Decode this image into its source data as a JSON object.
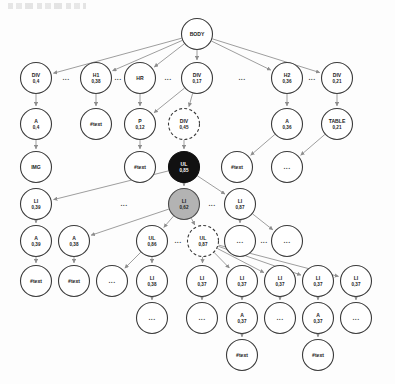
{
  "figure": {
    "kind": "dom-tree-diagram",
    "ellipsis_glyph": "...",
    "unlabeled_glyph": "...",
    "colors": {
      "node_stroke": "#3b3b3b",
      "node_fill": "#ffffff",
      "highlight_black": "#111111",
      "highlight_grey": "#b3b3b3",
      "edge": "#8d8d8d",
      "text": "#1c1c1c"
    }
  },
  "nodes": [
    {
      "id": "body",
      "label": "BODY",
      "value": "",
      "cx": 197,
      "cy": 34,
      "r": 15.5,
      "style": "plain"
    },
    {
      "id": "div-04",
      "label": "DIV",
      "value": "0,4",
      "cx": 36,
      "cy": 78,
      "r": 15.5,
      "style": "plain"
    },
    {
      "id": "h1-038",
      "label": "H1",
      "value": "0,38",
      "cx": 96,
      "cy": 78,
      "r": 15.5,
      "style": "plain"
    },
    {
      "id": "hr",
      "label": "HR",
      "value": "",
      "cx": 140,
      "cy": 78,
      "r": 15.5,
      "style": "plain"
    },
    {
      "id": "div-017",
      "label": "DIV",
      "value": "0,17",
      "cx": 197,
      "cy": 78,
      "r": 15.5,
      "style": "plain"
    },
    {
      "id": "h2-036",
      "label": "H2",
      "value": "0,36",
      "cx": 287,
      "cy": 78,
      "r": 15.5,
      "style": "plain"
    },
    {
      "id": "div-021",
      "label": "DIV",
      "value": "0,21",
      "cx": 337,
      "cy": 78,
      "r": 15.5,
      "style": "plain"
    },
    {
      "id": "a-04",
      "label": "A",
      "value": "0,4",
      "cx": 36,
      "cy": 124,
      "r": 15.5,
      "style": "plain"
    },
    {
      "id": "text-h1",
      "label": "#text",
      "value": "",
      "cx": 96,
      "cy": 124,
      "r": 15.5,
      "style": "plain"
    },
    {
      "id": "p-012",
      "label": "P",
      "value": "0,12",
      "cx": 140,
      "cy": 124,
      "r": 15.5,
      "style": "plain"
    },
    {
      "id": "div-045",
      "label": "DIV",
      "value": "0,45",
      "cx": 184,
      "cy": 124,
      "r": 15.5,
      "style": "dashed"
    },
    {
      "id": "a-036",
      "label": "A",
      "value": "0,36",
      "cx": 287,
      "cy": 124,
      "r": 15.5,
      "style": "plain"
    },
    {
      "id": "table-021",
      "label": "TABLE",
      "value": "0,21",
      "cx": 337,
      "cy": 124,
      "r": 15.5,
      "style": "plain"
    },
    {
      "id": "img",
      "label": "IMG",
      "value": "",
      "cx": 36,
      "cy": 167,
      "r": 15.5,
      "style": "plain"
    },
    {
      "id": "text-p",
      "label": "#text",
      "value": "",
      "cx": 140,
      "cy": 167,
      "r": 15.5,
      "style": "plain"
    },
    {
      "id": "ul-085",
      "label": "UL",
      "value": "0,85",
      "cx": 184,
      "cy": 167,
      "r": 15.5,
      "style": "black"
    },
    {
      "id": "text-a2",
      "label": "#text",
      "value": "",
      "cx": 237,
      "cy": 167,
      "r": 15.5,
      "style": "plain"
    },
    {
      "id": "dots-table",
      "label": "...",
      "value": "",
      "cx": 287,
      "cy": 167,
      "r": 15.5,
      "style": "plain"
    },
    {
      "id": "li-039",
      "label": "LI",
      "value": "0,39",
      "cx": 36,
      "cy": 204,
      "r": 15.5,
      "style": "plain"
    },
    {
      "id": "li-062",
      "label": "LI",
      "value": "0,62",
      "cx": 184,
      "cy": 204,
      "r": 15.5,
      "style": "grey"
    },
    {
      "id": "li-087",
      "label": "LI",
      "value": "0,87",
      "cx": 240,
      "cy": 204,
      "r": 15.5,
      "style": "plain"
    },
    {
      "id": "a-039",
      "label": "A",
      "value": "0,39",
      "cx": 36,
      "cy": 241,
      "r": 15.5,
      "style": "plain"
    },
    {
      "id": "a-038",
      "label": "A",
      "value": "0,38",
      "cx": 74,
      "cy": 241,
      "r": 15.5,
      "style": "plain"
    },
    {
      "id": "ul-086",
      "label": "UL",
      "value": "0,86",
      "cx": 152,
      "cy": 241,
      "r": 15.5,
      "style": "plain"
    },
    {
      "id": "ul-087",
      "label": "UL",
      "value": "0,87",
      "cx": 203,
      "cy": 241,
      "r": 15.5,
      "style": "dashed"
    },
    {
      "id": "dots-li87a",
      "label": "...",
      "value": "",
      "cx": 240,
      "cy": 241,
      "r": 15.5,
      "style": "plain"
    },
    {
      "id": "dots-li87b",
      "label": "...",
      "value": "",
      "cx": 287,
      "cy": 241,
      "r": 15.5,
      "style": "plain"
    },
    {
      "id": "text-a039",
      "label": "#text",
      "value": "",
      "cx": 36,
      "cy": 281,
      "r": 15.5,
      "style": "plain"
    },
    {
      "id": "text-a038",
      "label": "#text",
      "value": "",
      "cx": 74,
      "cy": 281,
      "r": 15.5,
      "style": "plain"
    },
    {
      "id": "dots-ul86",
      "label": "...",
      "value": "",
      "cx": 112,
      "cy": 281,
      "r": 15.5,
      "style": "plain"
    },
    {
      "id": "li-038b",
      "label": "LI",
      "value": "0,38",
      "cx": 152,
      "cy": 281,
      "r": 15.5,
      "style": "plain"
    },
    {
      "id": "li-037a",
      "label": "LI",
      "value": "0,37",
      "cx": 202,
      "cy": 281,
      "r": 15.5,
      "style": "plain"
    },
    {
      "id": "li-037b",
      "label": "LI",
      "value": "0,37",
      "cx": 242,
      "cy": 281,
      "r": 15.5,
      "style": "plain"
    },
    {
      "id": "li-037c",
      "label": "LI",
      "value": "0,37",
      "cx": 280,
      "cy": 281,
      "r": 15.5,
      "style": "plain"
    },
    {
      "id": "li-037d",
      "label": "LI",
      "value": "0,37",
      "cx": 318,
      "cy": 281,
      "r": 15.5,
      "style": "plain"
    },
    {
      "id": "li-037e",
      "label": "LI",
      "value": "0,37",
      "cx": 356,
      "cy": 281,
      "r": 15.5,
      "style": "plain"
    },
    {
      "id": "dots-li38b",
      "label": "...",
      "value": "",
      "cx": 152,
      "cy": 318,
      "r": 15.5,
      "style": "plain"
    },
    {
      "id": "dots-li37a",
      "label": "...",
      "value": "",
      "cx": 202,
      "cy": 318,
      "r": 15.5,
      "style": "plain"
    },
    {
      "id": "a-037a",
      "label": "A",
      "value": "0,37",
      "cx": 242,
      "cy": 318,
      "r": 15.5,
      "style": "plain"
    },
    {
      "id": "dots-li37c",
      "label": "...",
      "value": "",
      "cx": 280,
      "cy": 318,
      "r": 15.5,
      "style": "plain"
    },
    {
      "id": "a-037b",
      "label": "A",
      "value": "0,37",
      "cx": 318,
      "cy": 318,
      "r": 15.5,
      "style": "plain"
    },
    {
      "id": "dots-li37e",
      "label": "...",
      "value": "",
      "cx": 356,
      "cy": 318,
      "r": 15.5,
      "style": "plain"
    },
    {
      "id": "text-a37a",
      "label": "#text",
      "value": "",
      "cx": 242,
      "cy": 355,
      "r": 15.5,
      "style": "plain"
    },
    {
      "id": "text-a37b",
      "label": "#text",
      "value": "",
      "cx": 318,
      "cy": 355,
      "r": 15.5,
      "style": "plain"
    }
  ],
  "edges": [
    [
      "body",
      "div-04"
    ],
    [
      "body",
      "h1-038"
    ],
    [
      "body",
      "hr"
    ],
    [
      "body",
      "div-017"
    ],
    [
      "body",
      "h2-036"
    ],
    [
      "body",
      "div-021"
    ],
    [
      "div-04",
      "a-04"
    ],
    [
      "h1-038",
      "text-h1"
    ],
    [
      "hr",
      "p-012"
    ],
    [
      "div-017",
      "div-045"
    ],
    [
      "div-017",
      "p-012"
    ],
    [
      "h2-036",
      "a-036"
    ],
    [
      "div-021",
      "table-021"
    ],
    [
      "a-04",
      "img"
    ],
    [
      "p-012",
      "text-p"
    ],
    [
      "div-045",
      "ul-085"
    ],
    [
      "a-036",
      "text-a2"
    ],
    [
      "table-021",
      "dots-table"
    ],
    [
      "ul-085",
      "li-039"
    ],
    [
      "ul-085",
      "li-062"
    ],
    [
      "ul-085",
      "li-087"
    ],
    [
      "li-039",
      "a-039"
    ],
    [
      "li-062",
      "a-038"
    ],
    [
      "li-062",
      "ul-086"
    ],
    [
      "li-062",
      "ul-087"
    ],
    [
      "li-087",
      "dots-li87a"
    ],
    [
      "li-087",
      "dots-li87b"
    ],
    [
      "a-039",
      "text-a039"
    ],
    [
      "a-038",
      "text-a038"
    ],
    [
      "ul-086",
      "dots-ul86"
    ],
    [
      "ul-086",
      "li-038b"
    ],
    [
      "ul-087",
      "li-037a"
    ],
    [
      "ul-087",
      "li-037b"
    ],
    [
      "ul-087",
      "li-037c"
    ],
    [
      "ul-087",
      "li-037d"
    ],
    [
      "ul-087",
      "li-037e"
    ],
    [
      "li-038b",
      "dots-li38b"
    ],
    [
      "li-037a",
      "dots-li37a"
    ],
    [
      "li-037b",
      "a-037a"
    ],
    [
      "li-037c",
      "dots-li37c"
    ],
    [
      "li-037d",
      "a-037b"
    ],
    [
      "li-037e",
      "dots-li37e"
    ],
    [
      "a-037a",
      "text-a37a"
    ],
    [
      "a-037b",
      "text-a37b"
    ]
  ],
  "ellipsis_markers": [
    {
      "id": "ell-r1-1",
      "x": 66,
      "y": 78,
      "text": "..."
    },
    {
      "id": "ell-r1-2",
      "x": 118,
      "y": 78,
      "text": "..."
    },
    {
      "id": "ell-r1-3",
      "x": 168,
      "y": 78,
      "text": "..."
    },
    {
      "id": "ell-r1-4",
      "x": 242,
      "y": 78,
      "text": "..."
    },
    {
      "id": "ell-r1-5",
      "x": 312,
      "y": 78,
      "text": "..."
    },
    {
      "id": "ell-r4-1",
      "x": 124,
      "y": 204,
      "text": "..."
    },
    {
      "id": "ell-r4-2",
      "x": 212,
      "y": 204,
      "text": "..."
    },
    {
      "id": "ell-r5-1",
      "x": 178,
      "y": 241,
      "text": "..."
    },
    {
      "id": "ell-r5-2",
      "x": 264,
      "y": 241,
      "text": "..."
    }
  ]
}
